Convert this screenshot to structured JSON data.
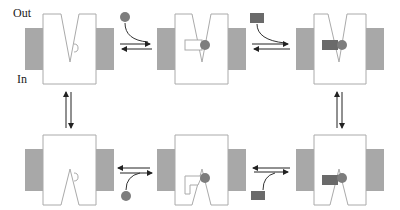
{
  "labels": {
    "out": "Out",
    "in": "In"
  },
  "colors": {
    "membrane": "#a8a8a8",
    "ligand_circle": "#7d7d7d",
    "ligand_rect": "#6a6a6a",
    "outline": "#aaaaaa",
    "arrow": "#222222"
  },
  "states": [
    {
      "id": "outward-open-empty",
      "row": 1,
      "col": 1
    },
    {
      "id": "outward-open-circle-bound",
      "row": 1,
      "col": 2
    },
    {
      "id": "outward-open-both-bound",
      "row": 1,
      "col": 3
    },
    {
      "id": "inward-open-empty",
      "row": 2,
      "col": 1
    },
    {
      "id": "inward-open-circle-bound",
      "row": 2,
      "col": 2
    },
    {
      "id": "inward-open-both-bound",
      "row": 2,
      "col": 3
    }
  ]
}
